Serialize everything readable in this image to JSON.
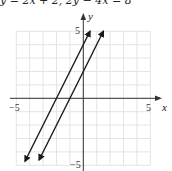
{
  "caption": "y = 2x + 2, 2y − 4x = 8",
  "chart_data": {
    "type": "line",
    "title": "y = 2x + 2, 2y − 4x = 8",
    "xlabel": "x",
    "ylabel": "y",
    "xlim": [
      -5,
      5
    ],
    "ylim": [
      -5,
      5
    ],
    "grid": true,
    "tick_labels": {
      "x": [
        "−5",
        "5"
      ],
      "y": [
        "5",
        "−5"
      ]
    },
    "series": [
      {
        "name": "2y − 4x = 8 (y = 2x + 4)",
        "slope": 2,
        "intercept": 4,
        "x": [
          -4.35,
          0.5
        ],
        "y": [
          -4.7,
          5
        ]
      },
      {
        "name": "y = 2x + 2",
        "slope": 2,
        "intercept": 2,
        "x": [
          -3.3,
          1.5
        ],
        "y": [
          -4.6,
          5
        ]
      }
    ],
    "legend": null
  },
  "axes": {
    "x_label": "x",
    "y_label": "y",
    "x_min_label": "−5",
    "x_max_label": "5",
    "y_max_label": "5",
    "y_min_label": "−5"
  },
  "style": {
    "line_color": "#1a1a1a",
    "grid_color": "#e4e4e4",
    "axis_color": "#333333"
  }
}
